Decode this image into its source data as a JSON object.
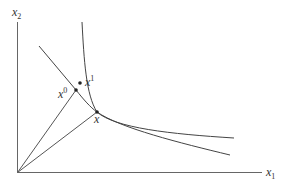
{
  "diagram": {
    "axes": {
      "x_label": "x",
      "x_label_sub": "1",
      "y_label": "x",
      "y_label_sub": "2"
    },
    "points": [
      {
        "id": "x0",
        "label": "x",
        "sup": "0"
      },
      {
        "id": "x1",
        "label": "x",
        "sup": "1"
      },
      {
        "id": "x",
        "label": "x",
        "sup": ""
      }
    ],
    "curves": [
      {
        "id": "indifference-curve",
        "description": "convex curve through x1 and x"
      },
      {
        "id": "second-curve",
        "description": "flatter curve through x0 and x"
      }
    ],
    "rays": [
      {
        "id": "ray-origin-to-x0"
      },
      {
        "id": "ray-origin-to-x"
      }
    ],
    "colors": {
      "line": "#555555",
      "text": "#333333",
      "background": "#ffffff"
    }
  }
}
